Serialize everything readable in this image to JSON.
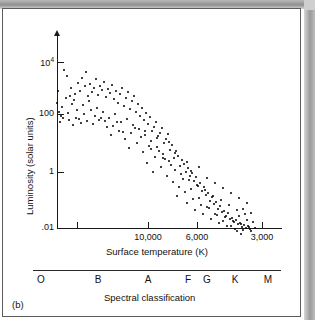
{
  "figure": {
    "panel_label": "(b)"
  },
  "chart_data": {
    "type": "scatter",
    "title": "",
    "xlabel": "Surface temperature (K)",
    "ylabel": "Luminosity (solar units)",
    "secondary_xlabel": "Spectral classification",
    "x_scale": "reversed-temperature",
    "y_scale": "log",
    "grid": false,
    "legend": "none",
    "xticks": [
      {
        "label": "",
        "px": 77
      },
      {
        "label": "10,000",
        "px": 148
      },
      {
        "label": "6,000",
        "px": 197
      },
      {
        "label": "3,000",
        "px": 262
      }
    ],
    "yticks": [
      {
        "label": "10",
        "exp": "4",
        "px": 62
      },
      {
        "label": "100",
        "exp": "",
        "px": 114
      },
      {
        "label": "1",
        "exp": "",
        "px": 172
      },
      {
        "label": ".01",
        "exp": "",
        "px": 228
      }
    ],
    "spectral_classes": [
      {
        "label": "O",
        "px": 41
      },
      {
        "label": "B",
        "px": 98
      },
      {
        "label": "A",
        "px": 148
      },
      {
        "label": "F",
        "px": 188
      },
      {
        "label": "G",
        "px": 207
      },
      {
        "label": "K",
        "px": 235
      },
      {
        "label": "M",
        "px": 268
      }
    ],
    "points": [
      [
        62,
        107
      ],
      [
        66,
        98
      ],
      [
        59,
        112
      ],
      [
        70,
        96
      ],
      [
        57,
        103
      ],
      [
        68,
        113
      ],
      [
        63,
        118
      ],
      [
        72,
        104
      ],
      [
        60,
        122
      ],
      [
        75,
        94
      ],
      [
        67,
        76
      ],
      [
        71,
        88
      ],
      [
        78,
        83
      ],
      [
        74,
        100
      ],
      [
        80,
        91
      ],
      [
        82,
        78
      ],
      [
        85,
        86
      ],
      [
        77,
        110
      ],
      [
        83,
        105
      ],
      [
        88,
        96
      ],
      [
        86,
        72
      ],
      [
        90,
        84
      ],
      [
        92,
        92
      ],
      [
        79,
        119
      ],
      [
        94,
        88
      ],
      [
        96,
        79
      ],
      [
        89,
        101
      ],
      [
        98,
        95
      ],
      [
        91,
        110
      ],
      [
        100,
        86
      ],
      [
        102,
        90
      ],
      [
        95,
        116
      ],
      [
        104,
        82
      ],
      [
        87,
        121
      ],
      [
        106,
        97
      ],
      [
        108,
        89
      ],
      [
        110,
        93
      ],
      [
        103,
        112
      ],
      [
        112,
        85
      ],
      [
        114,
        99
      ],
      [
        99,
        120
      ],
      [
        116,
        91
      ],
      [
        118,
        103
      ],
      [
        109,
        118
      ],
      [
        120,
        94
      ],
      [
        122,
        88
      ],
      [
        124,
        106
      ],
      [
        115,
        114
      ],
      [
        126,
        98
      ],
      [
        128,
        92
      ],
      [
        130,
        109
      ],
      [
        121,
        122
      ],
      [
        132,
        101
      ],
      [
        134,
        96
      ],
      [
        136,
        112
      ],
      [
        127,
        119
      ],
      [
        138,
        104
      ],
      [
        140,
        116
      ],
      [
        133,
        125
      ],
      [
        142,
        108
      ],
      [
        144,
        120
      ],
      [
        146,
        113
      ],
      [
        139,
        129
      ],
      [
        148,
        124
      ],
      [
        150,
        117
      ],
      [
        152,
        131
      ],
      [
        145,
        135
      ],
      [
        154,
        127
      ],
      [
        156,
        122
      ],
      [
        158,
        136
      ],
      [
        151,
        141
      ],
      [
        160,
        133
      ],
      [
        162,
        128
      ],
      [
        164,
        143
      ],
      [
        157,
        147
      ],
      [
        166,
        139
      ],
      [
        168,
        134
      ],
      [
        170,
        150
      ],
      [
        163,
        154
      ],
      [
        172,
        145
      ],
      [
        174,
        158
      ],
      [
        176,
        151
      ],
      [
        169,
        161
      ],
      [
        178,
        156
      ],
      [
        180,
        166
      ],
      [
        182,
        160
      ],
      [
        175,
        170
      ],
      [
        184,
        164
      ],
      [
        186,
        172
      ],
      [
        188,
        168
      ],
      [
        190,
        176
      ],
      [
        183,
        179
      ],
      [
        192,
        173
      ],
      [
        194,
        181
      ],
      [
        196,
        177
      ],
      [
        198,
        186
      ],
      [
        191,
        189
      ],
      [
        200,
        183
      ],
      [
        202,
        191
      ],
      [
        204,
        187
      ],
      [
        206,
        195
      ],
      [
        199,
        198
      ],
      [
        208,
        193
      ],
      [
        210,
        201
      ],
      [
        212,
        197
      ],
      [
        214,
        204
      ],
      [
        207,
        207
      ],
      [
        216,
        202
      ],
      [
        218,
        209
      ],
      [
        220,
        206
      ],
      [
        222,
        212
      ],
      [
        215,
        214
      ],
      [
        224,
        211
      ],
      [
        226,
        216
      ],
      [
        228,
        213
      ],
      [
        230,
        219
      ],
      [
        223,
        221
      ],
      [
        232,
        218
      ],
      [
        234,
        222
      ],
      [
        236,
        220
      ],
      [
        238,
        224
      ],
      [
        231,
        226
      ],
      [
        240,
        223
      ],
      [
        242,
        227
      ],
      [
        244,
        225
      ],
      [
        246,
        228
      ],
      [
        248,
        226
      ],
      [
        250,
        229
      ],
      [
        243,
        230
      ],
      [
        237,
        231
      ],
      [
        64,
        70
      ],
      [
        58,
        91
      ],
      [
        73,
        125
      ],
      [
        93,
        124
      ],
      [
        107,
        127
      ],
      [
        119,
        131
      ],
      [
        111,
        135
      ],
      [
        125,
        139
      ],
      [
        137,
        143
      ],
      [
        129,
        148
      ],
      [
        143,
        152
      ],
      [
        155,
        157
      ],
      [
        147,
        163
      ],
      [
        161,
        167
      ],
      [
        153,
        172
      ],
      [
        167,
        176
      ],
      [
        173,
        182
      ],
      [
        179,
        187
      ],
      [
        185,
        192
      ],
      [
        177,
        196
      ],
      [
        193,
        199
      ],
      [
        187,
        203
      ],
      [
        201,
        205
      ],
      [
        195,
        210
      ],
      [
        209,
        208
      ],
      [
        203,
        214
      ],
      [
        217,
        215
      ],
      [
        211,
        219
      ],
      [
        225,
        217
      ],
      [
        219,
        223
      ],
      [
        233,
        221
      ],
      [
        227,
        226
      ],
      [
        241,
        224
      ],
      [
        235,
        229
      ],
      [
        249,
        227
      ],
      [
        84,
        114
      ],
      [
        97,
        108
      ],
      [
        105,
        121
      ],
      [
        113,
        126
      ],
      [
        131,
        133
      ],
      [
        141,
        137
      ],
      [
        149,
        146
      ],
      [
        159,
        151
      ],
      [
        165,
        159
      ],
      [
        171,
        165
      ],
      [
        181,
        174
      ],
      [
        189,
        180
      ],
      [
        197,
        185
      ],
      [
        205,
        190
      ],
      [
        213,
        196
      ],
      [
        221,
        200
      ],
      [
        229,
        205
      ],
      [
        237,
        210
      ],
      [
        245,
        214
      ],
      [
        247,
        220
      ],
      [
        239,
        216
      ],
      [
        253,
        222
      ],
      [
        251,
        231
      ],
      [
        255,
        228
      ],
      [
        241,
        234
      ],
      [
        61,
        116
      ],
      [
        69,
        120
      ],
      [
        76,
        118
      ],
      [
        81,
        123
      ],
      [
        101,
        118
      ],
      [
        117,
        122
      ],
      [
        135,
        128
      ],
      [
        123,
        132
      ],
      [
        145,
        131
      ],
      [
        157,
        138
      ],
      [
        169,
        142
      ],
      [
        151,
        149
      ],
      [
        175,
        153
      ],
      [
        163,
        158
      ],
      [
        187,
        162
      ],
      [
        199,
        167
      ],
      [
        191,
        171
      ],
      [
        207,
        178
      ],
      [
        215,
        183
      ],
      [
        223,
        188
      ],
      [
        231,
        193
      ],
      [
        239,
        198
      ],
      [
        247,
        203
      ],
      [
        243,
        209
      ],
      [
        251,
        213
      ]
    ]
  }
}
